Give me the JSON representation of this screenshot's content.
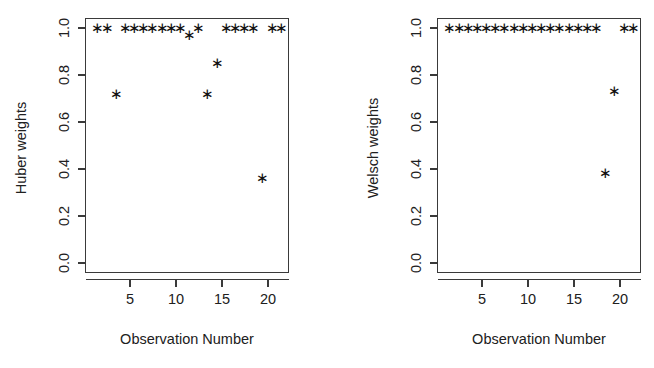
{
  "figure": {
    "background": "#ffffff",
    "foreground": "#1a1a1a",
    "panel_count": 2
  },
  "chart_data": [
    {
      "type": "scatter",
      "panel": "left",
      "title": "",
      "xlabel": "Observation Number",
      "ylabel": "Huber weights",
      "xlim": [
        0.2,
        21.8
      ],
      "ylim": [
        -0.02,
        1.05
      ],
      "xticks": [
        5,
        10,
        15,
        20
      ],
      "xticklabels": [
        "5",
        "10",
        "15",
        "20"
      ],
      "yticks": [
        0.0,
        0.2,
        0.4,
        0.6,
        0.8,
        1.0
      ],
      "yticklabels": [
        "0.0",
        "0.2",
        "0.4",
        "0.6",
        "0.8",
        "1.0"
      ],
      "grid": false,
      "legend": false,
      "marker": "asterisk",
      "marker_color": "#111111",
      "x": [
        1,
        2,
        3,
        4,
        5,
        6,
        7,
        8,
        9,
        10,
        11,
        12,
        13,
        14,
        15,
        16,
        17,
        18,
        19,
        20,
        21
      ],
      "y": [
        1.0,
        1.0,
        0.72,
        1.0,
        1.0,
        1.0,
        1.0,
        1.0,
        1.0,
        1.0,
        0.97,
        1.0,
        0.72,
        0.85,
        1.0,
        1.0,
        1.0,
        1.0,
        0.36,
        1.0,
        1.0
      ]
    },
    {
      "type": "scatter",
      "panel": "right",
      "title": "",
      "xlabel": "Observation Number",
      "ylabel": "Welsch weights",
      "xlim": [
        0.2,
        21.8
      ],
      "ylim": [
        -0.02,
        1.05
      ],
      "xticks": [
        5,
        10,
        15,
        20
      ],
      "xticklabels": [
        "5",
        "10",
        "15",
        "20"
      ],
      "yticks": [
        0.0,
        0.2,
        0.4,
        0.6,
        0.8,
        1.0
      ],
      "yticklabels": [
        "0.0",
        "0.2",
        "0.4",
        "0.6",
        "0.8",
        "1.0"
      ],
      "grid": false,
      "legend": false,
      "marker": "asterisk",
      "marker_color": "#111111",
      "x": [
        1,
        2,
        3,
        4,
        5,
        6,
        7,
        8,
        9,
        10,
        11,
        12,
        13,
        14,
        15,
        16,
        17,
        18,
        19,
        20,
        21
      ],
      "y": [
        1.0,
        1.0,
        1.0,
        1.0,
        1.0,
        1.0,
        1.0,
        1.0,
        1.0,
        1.0,
        1.0,
        1.0,
        1.0,
        1.0,
        1.0,
        1.0,
        1.0,
        0.385,
        0.73,
        1.0,
        1.0
      ]
    }
  ],
  "left_panel": {
    "ylabel": "Huber weights",
    "xlabel": "Observation Number",
    "ytick_labels": [
      "1.0",
      "0.8",
      "0.6",
      "0.4",
      "0.2",
      "0.0"
    ],
    "xtick_labels": [
      "5",
      "10",
      "15",
      "20"
    ]
  },
  "right_panel": {
    "ylabel": "Welsch weights",
    "xlabel": "Observation Number",
    "ytick_labels": [
      "1.0",
      "0.8",
      "0.6",
      "0.4",
      "0.2",
      "0.0"
    ],
    "xtick_labels": [
      "5",
      "10",
      "15",
      "20"
    ]
  }
}
